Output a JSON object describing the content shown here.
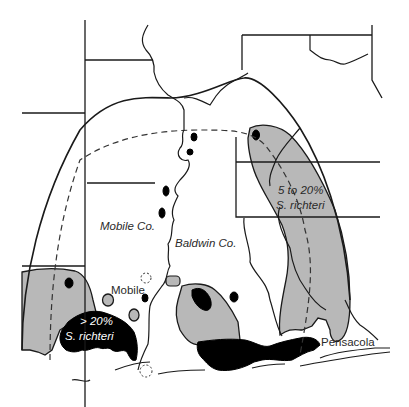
{
  "map": {
    "title": "S. richteri distribution near Mobile Bay",
    "colors": {
      "background": "#ffffff",
      "line": "#1a1a1a",
      "zone_5_to_20": "#b8b8b8",
      "zone_over_20": "#000000"
    },
    "labels": {
      "mobile_county": "Mobile Co.",
      "baldwin_county": "Baldwin Co.",
      "mobile_city": "Mobile",
      "pensacola_city": "Pensacola",
      "zone_high_line1": "> 20%",
      "zone_high_line2": "S. richteri",
      "zone_mid_line1": "5 to 20%",
      "zone_mid_line2": "S. richteri"
    },
    "legend_zones": [
      {
        "name": "> 20% S. richteri",
        "fill": "black"
      },
      {
        "name": "5 to 20% S. richteri",
        "fill": "gray"
      }
    ]
  }
}
